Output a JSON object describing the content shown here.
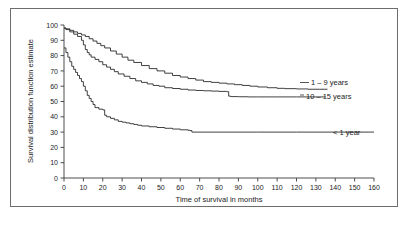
{
  "chart_data": {
    "type": "line",
    "title": "",
    "subtitle": "",
    "xlabel": "Time of survival in months",
    "ylabel": "Survival distribution function estimate",
    "xlim": [
      0,
      160
    ],
    "ylim": [
      0,
      100
    ],
    "grid": false,
    "legend_position": "right-inline",
    "xticks": [
      0,
      10,
      20,
      30,
      40,
      50,
      60,
      70,
      80,
      90,
      100,
      110,
      120,
      130,
      140,
      150,
      160
    ],
    "xtick_labels": [
      "0",
      "10",
      "20",
      "30",
      "40",
      "50",
      "60",
      "70",
      "80",
      "90",
      "100",
      "110",
      "120",
      "130",
      "140",
      "150",
      "160"
    ],
    "yticks": [
      0,
      10,
      20,
      30,
      40,
      50,
      60,
      70,
      80,
      90,
      100
    ],
    "ytick_labels": [
      "0",
      "10",
      "20",
      "30",
      "40",
      "50",
      "60",
      "70",
      "80",
      "90",
      "100"
    ],
    "curve_style": "step",
    "series": [
      {
        "name": "1 – 9 years",
        "label": "1 – 9 years",
        "color": "#2b2b2b",
        "x": [
          0,
          1,
          3,
          5,
          7,
          9,
          11,
          13,
          15,
          17,
          19,
          21,
          24,
          27,
          30,
          33,
          36,
          40,
          44,
          48,
          52,
          56,
          60,
          64,
          68,
          72,
          76,
          80,
          84,
          88,
          92,
          96,
          100,
          105,
          110,
          114,
          120,
          126,
          132,
          136
        ],
        "y": [
          98,
          97.5,
          96.5,
          95.5,
          94.5,
          93.5,
          92.5,
          91,
          89.5,
          88,
          86.5,
          85,
          83,
          81,
          79,
          77,
          75.5,
          73.5,
          71.5,
          70,
          68.5,
          67,
          66,
          65,
          64,
          63,
          62.5,
          62,
          61.5,
          61,
          60.5,
          60,
          59.5,
          59,
          58.6,
          58.4,
          58.2,
          58,
          58,
          58
        ]
      },
      {
        "name": "10 – 15 years",
        "label": "10 – 15 years",
        "color": "#2b2b2b",
        "x": [
          0,
          1,
          3,
          5,
          7,
          9,
          10,
          11,
          12,
          13,
          14,
          16,
          18,
          20,
          22,
          24,
          26,
          28,
          31,
          34,
          37,
          40,
          43,
          46,
          49,
          52,
          56,
          60,
          64,
          68,
          72,
          76,
          80,
          84,
          85,
          86,
          90,
          95,
          100,
          110,
          120,
          130,
          135
        ],
        "y": [
          98,
          97,
          95.5,
          94,
          92.5,
          90,
          87,
          84,
          82,
          80.5,
          79,
          77.5,
          76,
          74,
          72.5,
          71,
          69.5,
          68,
          66.5,
          65,
          63.5,
          62.5,
          61.5,
          60.5,
          60,
          59,
          58.5,
          58,
          57.5,
          57.2,
          57,
          56.8,
          56.6,
          56.4,
          53.5,
          53.2,
          53.1,
          53,
          53,
          53,
          53,
          53,
          53
        ]
      },
      {
        "name": "< 1 year",
        "label": "< 1 year",
        "color": "#2b2b2b",
        "x": [
          0,
          1,
          2,
          3,
          4,
          5,
          6,
          7,
          8,
          9,
          10,
          11,
          12,
          13,
          14,
          15,
          16,
          18,
          20,
          21,
          22,
          24,
          26,
          28,
          30,
          32,
          34,
          36,
          38,
          40,
          44,
          48,
          52,
          56,
          60,
          64,
          65,
          66,
          80,
          100,
          120,
          140,
          160
        ],
        "y": [
          85,
          82,
          79,
          76,
          73,
          71,
          69,
          67,
          65,
          63,
          60,
          57,
          54,
          52,
          50,
          48,
          46,
          45,
          44.5,
          41,
          40,
          39,
          38,
          37,
          36.5,
          36,
          35.5,
          35,
          34.5,
          34,
          33.5,
          33,
          32.5,
          32,
          31.5,
          31.2,
          31,
          30,
          30,
          30,
          30,
          30,
          30
        ]
      }
    ],
    "annotations": [
      {
        "text": "1 – 9 years",
        "x": 138,
        "y": 58
      },
      {
        "text": "10 – 15 years",
        "x": 137,
        "y": 53
      },
      {
        "text": "< 1 year",
        "x": 162,
        "y": 30
      }
    ]
  }
}
